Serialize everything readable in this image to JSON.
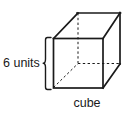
{
  "figure": {
    "type": "geometry-diagram",
    "subject": "cube",
    "background_color": "#ffffff",
    "stroke_color": "#1a1a1a",
    "labels": {
      "dimension": "6 units",
      "shape_name": "cube"
    },
    "dimension": {
      "value": 6,
      "unit": "units",
      "measures": "edge length",
      "brace_side": "left"
    },
    "geometry": {
      "projection": "oblique",
      "depth_offset_x": 25,
      "depth_offset_y": -25,
      "front_face": {
        "top_left": [
          53,
          38
        ],
        "top_right": [
          103,
          38
        ],
        "bottom_right": [
          103,
          88
        ],
        "bottom_left": [
          53,
          88
        ]
      },
      "back_face": {
        "top_left": [
          78,
          13
        ],
        "top_right": [
          120,
          13
        ],
        "bottom_right": [
          120,
          63
        ],
        "bottom_left": [
          78,
          63
        ]
      },
      "visible_edges": [
        "front-top",
        "front-right",
        "front-bottom",
        "front-left",
        "back-top",
        "back-right-vertical",
        "top-left-diagonal",
        "top-right-diagonal",
        "bottom-right-diagonal"
      ],
      "hidden_edges": [
        "back-left-vertical",
        "back-bottom-horizontal",
        "bottom-left-diagonal"
      ]
    }
  }
}
